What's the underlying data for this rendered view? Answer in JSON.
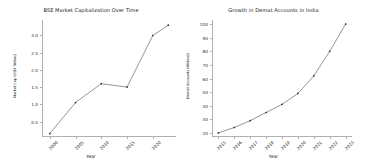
{
  "figure": {
    "background": "#ffffff",
    "line_color": "#3a3a4a",
    "marker_color": "#2b2b35",
    "axis_color": "#b0b0b0"
  },
  "chart_data": [
    {
      "type": "line",
      "title": "BSE Market Capitalization Over Time",
      "xlabel": "Year",
      "ylabel": "Market Cap (USD Trillion)",
      "x": [
        2000,
        2005,
        2010,
        2015,
        2020,
        2023
      ],
      "values": [
        0.15,
        1.05,
        1.6,
        1.5,
        3.0,
        3.3
      ],
      "xticks": [
        "2000",
        "2005",
        "2010",
        "2015",
        "2020"
      ],
      "xtick_values": [
        2000,
        2005,
        2010,
        2015,
        2020
      ],
      "yticks": [
        "0.5",
        "1.0",
        "1.5",
        "2.0",
        "2.5",
        "3.0"
      ],
      "ytick_values": [
        0.5,
        1.0,
        1.5,
        2.0,
        2.5,
        3.0
      ],
      "xlim": [
        1998.5,
        2024.5
      ],
      "ylim": [
        0.05,
        3.45
      ],
      "grid": false,
      "legend": "none",
      "marker": "dot"
    },
    {
      "type": "line",
      "title": "Growth in Demat Accounts in India",
      "xlabel": "Year",
      "ylabel": "Demat Accounts (Millions)",
      "x": [
        2015,
        2016,
        2017,
        2018,
        2019,
        2020,
        2021,
        2022,
        2023
      ],
      "values": [
        20,
        24,
        29,
        35,
        41,
        49,
        62,
        80,
        100
      ],
      "xticks": [
        "2015",
        "2016",
        "2017",
        "2018",
        "2019",
        "2020",
        "2021",
        "2022",
        "2023"
      ],
      "xtick_values": [
        2015,
        2016,
        2017,
        2018,
        2019,
        2020,
        2021,
        2022,
        2023
      ],
      "yticks": [
        "20",
        "30",
        "40",
        "50",
        "60",
        "70",
        "80",
        "90",
        "100"
      ],
      "ytick_values": [
        20,
        30,
        40,
        50,
        60,
        70,
        80,
        90,
        100
      ],
      "xlim": [
        2014.6,
        2023.4
      ],
      "ylim": [
        17,
        103
      ],
      "grid": false,
      "legend": "none",
      "marker": "dot"
    }
  ]
}
